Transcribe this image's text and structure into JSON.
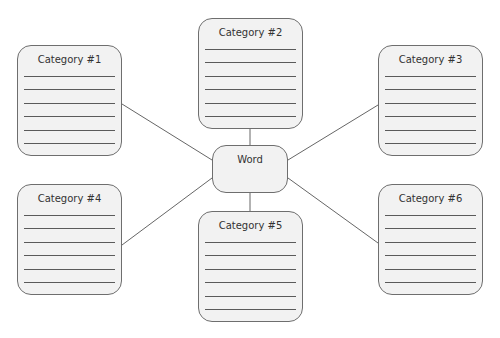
{
  "center": {
    "label": "Word"
  },
  "categories": [
    {
      "label": "Category #1",
      "x": 17,
      "y": 45
    },
    {
      "label": "Category #2",
      "x": 198,
      "y": 18
    },
    {
      "label": "Category #3",
      "x": 378,
      "y": 45
    },
    {
      "label": "Category #4",
      "x": 17,
      "y": 184
    },
    {
      "label": "Category #5",
      "x": 198,
      "y": 211
    },
    {
      "label": "Category #6",
      "x": 378,
      "y": 184
    }
  ],
  "lines_per_box": 6
}
